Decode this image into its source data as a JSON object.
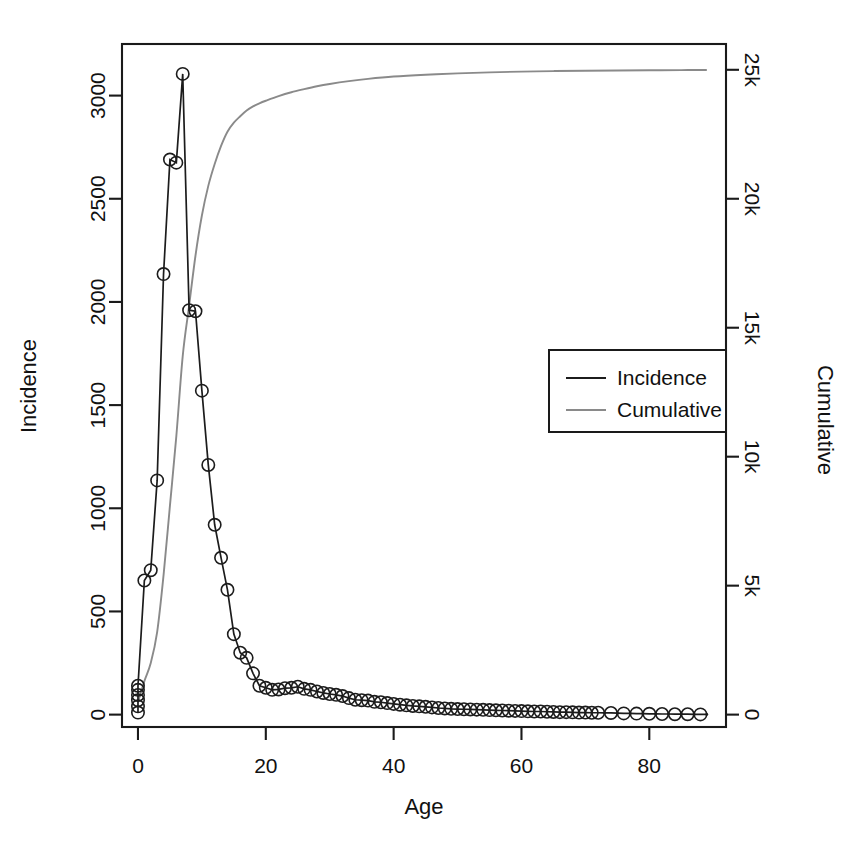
{
  "chart_data": {
    "type": "line",
    "title": "",
    "xlabel": "Age",
    "ylabel": "Incidence",
    "y2label": "Cumulative",
    "xlim": [
      -2.5,
      92
    ],
    "ylim": [
      -60,
      3250
    ],
    "y2lim": [
      -480,
      26000
    ],
    "grid": false,
    "legend_position": "center-right",
    "xticks": [
      0,
      20,
      40,
      60,
      80
    ],
    "xticklabels": [
      "0",
      "20",
      "40",
      "60",
      "80"
    ],
    "yticks": [
      0,
      500,
      1000,
      1500,
      2000,
      2500,
      3000
    ],
    "yticklabels": [
      "0",
      "500",
      "1000",
      "1500",
      "2000",
      "2500",
      "3000"
    ],
    "y2ticks": [
      0,
      5000,
      10000,
      15000,
      20000,
      25000
    ],
    "y2ticklabels": [
      "0",
      "5k",
      "10k",
      "15k",
      "20k",
      "25k"
    ],
    "colors": {
      "incidence": "#1c1c1c",
      "cumulative": "#8a8a8a",
      "frame": "#1a1a1a",
      "background": "#ffffff"
    },
    "series": [
      {
        "name": "Incidence",
        "color": "#1c1c1c",
        "marker": "open-circle",
        "x": [
          0,
          0,
          0,
          0,
          0,
          0,
          1,
          2,
          3,
          4,
          5,
          6,
          7,
          8,
          9,
          10,
          11,
          12,
          13,
          14,
          15,
          16,
          17,
          18,
          19,
          20,
          21,
          22,
          23,
          24,
          25,
          26,
          27,
          28,
          29,
          30,
          31,
          32,
          33,
          34,
          35,
          36,
          37,
          38,
          39,
          40,
          41,
          42,
          43,
          44,
          45,
          46,
          47,
          48,
          49,
          50,
          51,
          52,
          53,
          54,
          55,
          56,
          57,
          58,
          59,
          60,
          61,
          62,
          63,
          64,
          65,
          66,
          67,
          68,
          69,
          70,
          71,
          72,
          73,
          74,
          75,
          76,
          77,
          78,
          79,
          80,
          81,
          82,
          83,
          84,
          85,
          86,
          87,
          88,
          89
        ],
        "values": [
          10,
          40,
          70,
          95,
          120,
          140,
          650,
          700,
          1135,
          2135,
          2690,
          2675,
          3105,
          1960,
          1955,
          1570,
          1210,
          920,
          760,
          605,
          390,
          300,
          275,
          200,
          140,
          130,
          120,
          122,
          128,
          130,
          135,
          125,
          120,
          112,
          105,
          100,
          96,
          90,
          80,
          72,
          70,
          68,
          62,
          60,
          56,
          52,
          48,
          45,
          42,
          40,
          38,
          35,
          32,
          30,
          28,
          27,
          26,
          25,
          24,
          23,
          22,
          21,
          20,
          19,
          18,
          17,
          16,
          15,
          15,
          14,
          13,
          12,
          12,
          11,
          10,
          10,
          9,
          9,
          8,
          8,
          7,
          6,
          6,
          5,
          5,
          4,
          4,
          3,
          3,
          2,
          2,
          2,
          1,
          1,
          1
        ]
      },
      {
        "name": "Cumulative",
        "color": "#8a8a8a",
        "marker": "none",
        "x": [
          0,
          1,
          2,
          3,
          4,
          5,
          6,
          7,
          8,
          9,
          10,
          11,
          12,
          13,
          14,
          15,
          16,
          17,
          18,
          19,
          20,
          22,
          24,
          26,
          28,
          30,
          33,
          36,
          40,
          45,
          50,
          55,
          60,
          65,
          70,
          75,
          80,
          85,
          89
        ],
        "values": [
          480,
          1300,
          2000,
          3200,
          5400,
          8100,
          10800,
          13900,
          15850,
          17800,
          19350,
          20500,
          21350,
          22050,
          22600,
          22950,
          23200,
          23420,
          23580,
          23700,
          23800,
          23980,
          24130,
          24250,
          24360,
          24450,
          24560,
          24650,
          24740,
          24810,
          24860,
          24900,
          24930,
          24950,
          24965,
          24975,
          24982,
          24988,
          24992
        ]
      }
    ],
    "legend_entries": [
      {
        "label": "Incidence",
        "color": "#1c1c1c"
      },
      {
        "label": "Cumulative",
        "color": "#8a8a8a"
      }
    ]
  }
}
